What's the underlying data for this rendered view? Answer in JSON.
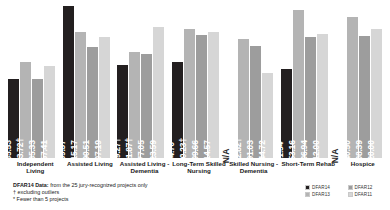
{
  "chart_data": {
    "type": "bar",
    "title": "",
    "xlabel": "",
    "ylabel": "",
    "ylim": [
      0,
      270
    ],
    "grid": false,
    "legend_position": "bottom-right",
    "categories": [
      "Independent Living",
      "Assisted Living",
      "Assisted Living - Dementia",
      "Long-Term Skilled Nursing",
      "Skilled Nursing - Dementia",
      "Short-Term Rehab",
      "Hospice"
    ],
    "series": [
      {
        "name": "DFAR14",
        "color": "#231f20",
        "values": [
          135.53,
          259.37,
          159.27,
          164.7,
          null,
          151.54,
          null
        ],
        "labels": [
          "$135.53",
          "$259.37",
          "$159.27†",
          "$164.70*",
          "N/A",
          "$151.54*",
          "N/A"
        ]
      },
      {
        "name": "DFAR13",
        "color": "#b4b4b4",
        "values": [
          163.72,
          215.17,
          181.87,
          220.23,
          202.82,
          253.16,
          240.5
        ],
        "labels": [
          "$163.72†",
          "$215.17",
          "$181.87†",
          "$220.23†",
          "$202.82†",
          "$253.16",
          "$240.50"
        ]
      },
      {
        "name": "DFAR12",
        "color": "#9d9d9d",
        "values": [
          135.33,
          190.51,
          177.05,
          209.66,
          191.03,
          206.94,
          208.39
        ],
        "labels": [
          "$135.33",
          "$190.51",
          "$177.05",
          "$209.66",
          "$191.03",
          "$206.94",
          "$208.39"
        ]
      },
      {
        "name": "DFAR11",
        "color": "#d6d6d6",
        "values": [
          157.41,
          207.19,
          223.59,
          214.57,
          144.72,
          212.0,
          220.0
        ],
        "labels": [
          "$157.41",
          "$207.19",
          "$223.59",
          "$214.57",
          "$144.72",
          "$212.00",
          "$220.00"
        ]
      }
    ]
  },
  "footnotes": {
    "line1_strong": "DFAR14 Data:",
    "line1_rest": " from the 25 jury-recognized projects only",
    "line2": "† excluding outliers",
    "line3": "* Fewer than 5 projects"
  },
  "legend": {
    "items": [
      {
        "label": "DFAR14",
        "color": "#231f20"
      },
      {
        "label": "DFAR12",
        "color": "#9d9d9d"
      },
      {
        "label": "DFAR13",
        "color": "#b4b4b4"
      },
      {
        "label": "DFAR11",
        "color": "#d6d6d6"
      }
    ]
  }
}
